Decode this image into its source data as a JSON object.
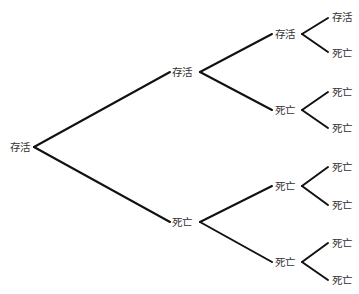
{
  "diagram": {
    "type": "tree",
    "orientation": "left-to-right",
    "colors": {
      "line": "#111111",
      "text": "#333333",
      "background": "#ffffff"
    },
    "nodes": [
      {
        "id": "n0",
        "label": "存活",
        "x": 10,
        "y": 151,
        "ax": 34,
        "ay": 147
      },
      {
        "id": "n1",
        "label": "存活",
        "x": 172,
        "y": 76,
        "ax": 170,
        "ay": 72,
        "bx": 200,
        "by": 72
      },
      {
        "id": "n2",
        "label": "死亡",
        "x": 172,
        "y": 226,
        "ax": 170,
        "ay": 222,
        "bx": 200,
        "by": 222
      },
      {
        "id": "n3",
        "label": "存活",
        "x": 275,
        "y": 38,
        "ax": 272,
        "ay": 34,
        "bx": 302,
        "by": 34
      },
      {
        "id": "n4",
        "label": "死亡",
        "x": 275,
        "y": 114,
        "ax": 272,
        "ay": 110,
        "bx": 302,
        "by": 110
      },
      {
        "id": "n5",
        "label": "死亡",
        "x": 275,
        "y": 190,
        "ax": 272,
        "ay": 186,
        "bx": 302,
        "by": 186
      },
      {
        "id": "n6",
        "label": "死亡",
        "x": 275,
        "y": 266,
        "ax": 272,
        "ay": 262,
        "bx": 302,
        "by": 262
      },
      {
        "id": "n7",
        "label": "存活",
        "x": 332,
        "y": 21,
        "ax": 328,
        "ay": 18
      },
      {
        "id": "n8",
        "label": "死亡",
        "x": 332,
        "y": 57,
        "ax": 328,
        "ay": 52
      },
      {
        "id": "n9",
        "label": "死亡",
        "x": 332,
        "y": 96,
        "ax": 328,
        "ay": 92
      },
      {
        "id": "n10",
        "label": "死亡",
        "x": 332,
        "y": 132,
        "ax": 328,
        "ay": 128
      },
      {
        "id": "n11",
        "label": "死亡",
        "x": 332,
        "y": 171,
        "ax": 328,
        "ay": 167
      },
      {
        "id": "n12",
        "label": "死亡",
        "x": 332,
        "y": 209,
        "ax": 328,
        "ay": 205
      },
      {
        "id": "n13",
        "label": "死亡",
        "x": 332,
        "y": 247,
        "ax": 328,
        "ay": 243
      },
      {
        "id": "n14",
        "label": "死亡",
        "x": 332,
        "y": 284,
        "ax": 328,
        "ay": 280
      }
    ],
    "edges": [
      {
        "from": "n0",
        "to": "n1"
      },
      {
        "from": "n0",
        "to": "n2"
      },
      {
        "from": "n1",
        "to": "n3"
      },
      {
        "from": "n1",
        "to": "n4"
      },
      {
        "from": "n2",
        "to": "n5"
      },
      {
        "from": "n2",
        "to": "n6"
      },
      {
        "from": "n3",
        "to": "n7"
      },
      {
        "from": "n3",
        "to": "n8"
      },
      {
        "from": "n4",
        "to": "n9"
      },
      {
        "from": "n4",
        "to": "n10"
      },
      {
        "from": "n5",
        "to": "n11"
      },
      {
        "from": "n5",
        "to": "n12"
      },
      {
        "from": "n6",
        "to": "n13"
      },
      {
        "from": "n6",
        "to": "n14"
      }
    ]
  }
}
